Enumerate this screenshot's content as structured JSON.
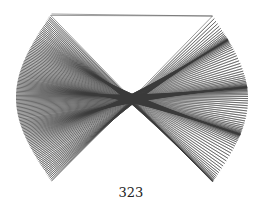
{
  "figure": {
    "stroke_color": "#3a3a3a",
    "line_count": 120,
    "corners": {
      "top_left": [
        53,
        14
      ],
      "top_right": [
        214,
        16
      ],
      "bottom_left": [
        50,
        181
      ],
      "bottom_right": [
        211,
        182
      ],
      "left_edge": [
        16,
        92
      ],
      "right_edge": [
        248,
        107
      ]
    },
    "waist": {
      "center": [
        130,
        97
      ],
      "top_y": 80,
      "bottom_y": 117
    }
  },
  "caption": {
    "label": "323"
  }
}
